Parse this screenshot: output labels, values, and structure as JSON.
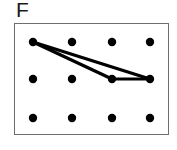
{
  "figure": {
    "label": "F",
    "background_color": "#ffffff"
  },
  "frame": {
    "name": "geoboard-frame",
    "x": 14,
    "y": 23,
    "width": 155,
    "height": 112,
    "border_color": "#6e6e6e",
    "border_width": 1.5,
    "fill_color": "#ffffff"
  },
  "grid": {
    "rows": 3,
    "columns": 4,
    "dot_radius": 4.2,
    "dot_color": "#000000",
    "column_x": [
      33,
      72,
      112,
      150
    ],
    "row_y": [
      42,
      79,
      118
    ],
    "dots": [
      {
        "id": "r0c0",
        "row": 0,
        "col": 0,
        "x": 33,
        "y": 42
      },
      {
        "id": "r0c1",
        "row": 0,
        "col": 1,
        "x": 72,
        "y": 42
      },
      {
        "id": "r0c2",
        "row": 0,
        "col": 2,
        "x": 112,
        "y": 42
      },
      {
        "id": "r0c3",
        "row": 0,
        "col": 3,
        "x": 150,
        "y": 42
      },
      {
        "id": "r1c0",
        "row": 1,
        "col": 0,
        "x": 33,
        "y": 79
      },
      {
        "id": "r1c1",
        "row": 1,
        "col": 1,
        "x": 72,
        "y": 79
      },
      {
        "id": "r1c2",
        "row": 1,
        "col": 2,
        "x": 112,
        "y": 79
      },
      {
        "id": "r1c3",
        "row": 1,
        "col": 3,
        "x": 150,
        "y": 79
      },
      {
        "id": "r2c0",
        "row": 2,
        "col": 0,
        "x": 33,
        "y": 118
      },
      {
        "id": "r2c1",
        "row": 2,
        "col": 1,
        "x": 72,
        "y": 118
      },
      {
        "id": "r2c2",
        "row": 2,
        "col": 2,
        "x": 112,
        "y": 118
      },
      {
        "id": "r2c3",
        "row": 2,
        "col": 3,
        "x": 150,
        "y": 118
      }
    ]
  },
  "shape": {
    "name": "triangle",
    "stroke_color": "#000000",
    "stroke_width": 3.2,
    "vertices": [
      "r0c0",
      "r1c2",
      "r1c3"
    ],
    "vertex_points": [
      {
        "x": 33,
        "y": 42
      },
      {
        "x": 112,
        "y": 79
      },
      {
        "x": 150,
        "y": 79
      }
    ],
    "edges": [
      {
        "id": "edge-a",
        "from": "r0c0",
        "to": "r1c2",
        "x1": 33,
        "y1": 42,
        "x2": 112,
        "y2": 79
      },
      {
        "id": "edge-b",
        "from": "r1c2",
        "to": "r1c3",
        "x1": 112,
        "y1": 79,
        "x2": 150,
        "y2": 79
      },
      {
        "id": "edge-c",
        "from": "r1c3",
        "to": "r0c0",
        "x1": 150,
        "y1": 79,
        "x2": 33,
        "y2": 42
      }
    ]
  }
}
